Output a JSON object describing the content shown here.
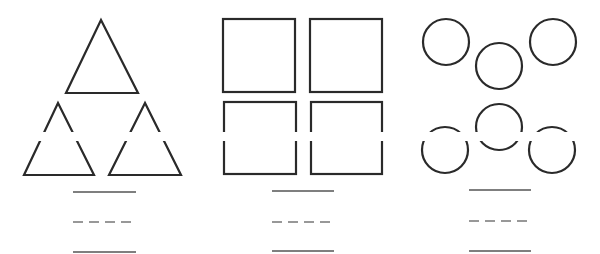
{
  "worksheet": {
    "background": "#ffffff",
    "stroke_color": "#2a2a2a",
    "groups": [
      {
        "name": "triangles",
        "shape": "triangle",
        "count": 3,
        "items": [
          {
            "points": "101,20 66,93 138,93"
          },
          {
            "points": "58,103 24,175 94,175"
          },
          {
            "points": "145,103 109,175 181,175"
          }
        ],
        "answer_lines": {
          "x1": 73,
          "x2": 136,
          "solid_top_y": 192,
          "dashed_y": 222,
          "solid_bottom_y": 252
        }
      },
      {
        "name": "squares",
        "shape": "square",
        "count": 4,
        "items": [
          {
            "x": 223,
            "y": 19,
            "w": 72,
            "h": 73
          },
          {
            "x": 310,
            "y": 19,
            "w": 72,
            "h": 73
          },
          {
            "x": 224,
            "y": 102,
            "w": 72,
            "h": 72
          },
          {
            "x": 311,
            "y": 102,
            "w": 71,
            "h": 72
          }
        ],
        "answer_lines": {
          "x1": 272,
          "x2": 334,
          "solid_top_y": 191,
          "dashed_y": 222,
          "solid_bottom_y": 251
        }
      },
      {
        "name": "circles",
        "shape": "circle",
        "count": 6,
        "items": [
          {
            "cx": 446,
            "cy": 42,
            "r": 23
          },
          {
            "cx": 499,
            "cy": 66,
            "r": 23
          },
          {
            "cx": 553,
            "cy": 42,
            "r": 23
          },
          {
            "cx": 499,
            "cy": 127,
            "r": 23
          },
          {
            "cx": 445,
            "cy": 150,
            "r": 23
          },
          {
            "cx": 552,
            "cy": 150,
            "r": 23
          }
        ],
        "answer_lines": {
          "x1": 469,
          "x2": 531,
          "solid_top_y": 190,
          "dashed_y": 221,
          "solid_bottom_y": 251
        }
      }
    ],
    "scan_gap": {
      "y": 132,
      "height": 9
    }
  }
}
